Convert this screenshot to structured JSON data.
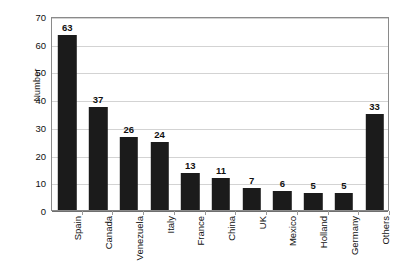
{
  "chart_data": {
    "type": "bar",
    "title": "",
    "xlabel": "",
    "ylabel": "Number",
    "ylim": [
      0,
      70
    ],
    "ytick_step": 10,
    "yticks": [
      70,
      60,
      50,
      40,
      30,
      20,
      10,
      0
    ],
    "grid": true,
    "legend": false,
    "orientation": "vertical",
    "bar_color": "#1b1b1b",
    "gridline_color": "#d3d3d3",
    "categories": [
      "Spain",
      "Canada",
      "Venezuela",
      "Italy",
      "France",
      "China",
      "UK",
      "Mexico",
      "Holland",
      "Germany",
      "Others"
    ],
    "values": [
      63,
      37,
      26,
      24,
      13,
      11,
      7,
      6,
      5,
      5,
      33
    ],
    "data_labels": [
      "63",
      "37",
      "26",
      "24",
      "13",
      "11",
      "7",
      "6",
      "5",
      "5",
      "33"
    ],
    "drawn_heights": [
      63,
      37,
      26.5,
      24.5,
      13.5,
      11.5,
      8,
      7,
      6,
      6,
      34.5
    ]
  }
}
